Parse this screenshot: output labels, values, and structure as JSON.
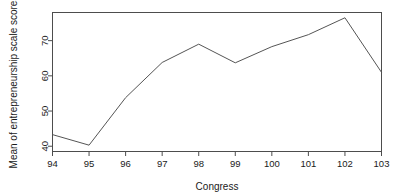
{
  "chart_data": {
    "type": "line",
    "title": "",
    "xlabel": "Congress",
    "ylabel": "Mean of entrepreneurship scale scores",
    "x": [
      94,
      95,
      96,
      97,
      98,
      99,
      100,
      101,
      102,
      103
    ],
    "categories": [
      "94",
      "95",
      "96",
      "97",
      "98",
      "99",
      "100",
      "101",
      "102",
      "103"
    ],
    "values": [
      43.3,
      40.3,
      53.8,
      63.8,
      69.0,
      63.7,
      68.3,
      71.7,
      76.5,
      61.0
    ],
    "series": [
      {
        "name": "Mean of entrepreneurship scale scores",
        "values": [
          43.3,
          40.3,
          53.8,
          63.8,
          69.0,
          63.7,
          68.3,
          71.7,
          76.5,
          61.0
        ]
      }
    ],
    "xlim": [
      94,
      103
    ],
    "ylim": [
      38.5,
      78.0
    ],
    "yticks": [
      40,
      50,
      60,
      70
    ],
    "ytick_labels": [
      "40",
      "50",
      "60",
      "70"
    ],
    "xticks": [
      94,
      95,
      96,
      97,
      98,
      99,
      100,
      101,
      102,
      103
    ],
    "xtick_labels": [
      "94",
      "95",
      "96",
      "97",
      "98",
      "99",
      "100",
      "101",
      "102",
      "103"
    ],
    "grid": false,
    "legend": false,
    "legend_position": "none",
    "line_color": "#555555",
    "axis_color": "#4d4d4d",
    "text_color": "#1a1a1a",
    "background_color": "#ffffff"
  },
  "axes": {
    "x_title": "Congress",
    "y_title": "Mean of entrepreneurship scale scores"
  }
}
